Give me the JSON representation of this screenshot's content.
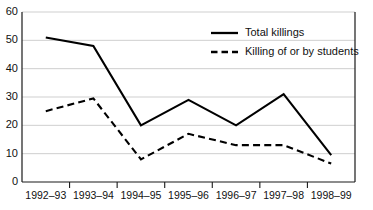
{
  "chart_data": {
    "type": "line",
    "title": "",
    "subtitle": "",
    "xlabel": "",
    "ylabel": "",
    "categories": [
      "1992–93",
      "1993–94",
      "1994–95",
      "1995–96",
      "1996–97",
      "1997–98",
      "1998–99"
    ],
    "series": [
      {
        "name": "Total killings",
        "style": "solid",
        "color": "#000000",
        "values": [
          51,
          48,
          20,
          29,
          20,
          31,
          9.5
        ]
      },
      {
        "name": "Killing of or by students",
        "style": "dashed",
        "color": "#000000",
        "values": [
          25,
          29.5,
          8,
          17,
          13,
          13,
          6.5
        ]
      }
    ],
    "ylim": [
      0,
      60
    ],
    "ytick_values": [
      0,
      10,
      20,
      30,
      40,
      50,
      60
    ],
    "ytick_labels": [
      "0",
      "10",
      "20",
      "30",
      "40",
      "50",
      "60"
    ],
    "grid": "horizontal",
    "grid_color": "#c9c9c9",
    "axis_color": "#1a1a1a",
    "background": "#ffffff",
    "legend_position": "upper-right-inside"
  },
  "legend": {
    "entries": [
      {
        "label": "Total killings",
        "style": "solid"
      },
      {
        "label": "Killing of or by students",
        "style": "dashed"
      }
    ]
  },
  "axes": {
    "y": {
      "labels": [
        "60",
        "50",
        "40",
        "30",
        "20",
        "10",
        "0"
      ]
    },
    "x": {
      "labels": [
        "1992–93",
        "1993–94",
        "1994–95",
        "1995–96",
        "1996–97",
        "1997–98",
        "1998–99"
      ]
    }
  }
}
